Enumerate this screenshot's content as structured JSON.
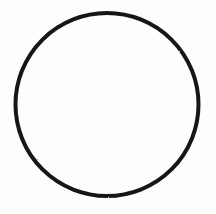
{
  "figure": {
    "type": "line-drawing",
    "title": "",
    "caption": "",
    "background_color": "#fdfdfd",
    "canvas": {
      "width": 216,
      "height": 214
    },
    "shapes": [
      {
        "name": "circle-outline",
        "kind": "circle",
        "center_x": 107,
        "center_y": 104.5,
        "radius": 91.5,
        "stroke_color": "#151515",
        "stroke_width": 4,
        "fill": "none",
        "bounding_box": {
          "left": 15.5,
          "top": 13,
          "right": 198.5,
          "bottom": 196
        }
      }
    ],
    "labels": [],
    "annotations": [],
    "text_content": ""
  }
}
